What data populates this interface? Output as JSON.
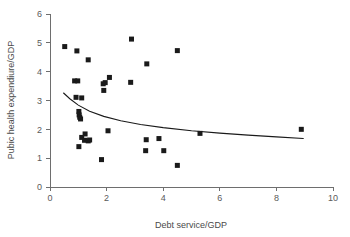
{
  "chart_data": {
    "type": "scatter",
    "title": "",
    "xlabel": "Debt service/GDP",
    "ylabel": "Pubic health expendiure/GDP",
    "xlim": [
      0,
      10
    ],
    "ylim": [
      0,
      6
    ],
    "xticks": [
      "0",
      "2",
      "4",
      "6",
      "8",
      "10"
    ],
    "xtick_values": [
      0,
      2,
      4,
      6,
      8,
      10
    ],
    "yticks": [
      "0",
      "1",
      "2",
      "3",
      "4",
      "5",
      "6"
    ],
    "ytick_values": [
      0,
      1,
      2,
      3,
      4,
      5,
      6
    ],
    "grid": false,
    "legend": null,
    "marker_shape": "square",
    "marker_color": "#1a1a1a",
    "points": [
      {
        "x": 0.52,
        "y": 4.87
      },
      {
        "x": 0.95,
        "y": 4.72
      },
      {
        "x": 1.35,
        "y": 4.41
      },
      {
        "x": 0.87,
        "y": 3.68
      },
      {
        "x": 0.98,
        "y": 3.68
      },
      {
        "x": 0.92,
        "y": 3.11
      },
      {
        "x": 1.12,
        "y": 3.09
      },
      {
        "x": 1.02,
        "y": 2.62
      },
      {
        "x": 1.03,
        "y": 2.5
      },
      {
        "x": 1.05,
        "y": 2.42
      },
      {
        "x": 1.08,
        "y": 2.36
      },
      {
        "x": 1.24,
        "y": 1.84
      },
      {
        "x": 1.12,
        "y": 1.72
      },
      {
        "x": 1.22,
        "y": 1.62
      },
      {
        "x": 1.35,
        "y": 1.6
      },
      {
        "x": 1.4,
        "y": 1.63
      },
      {
        "x": 1.02,
        "y": 1.4
      },
      {
        "x": 1.82,
        "y": 0.95
      },
      {
        "x": 1.9,
        "y": 3.35
      },
      {
        "x": 1.88,
        "y": 3.58
      },
      {
        "x": 1.95,
        "y": 3.62
      },
      {
        "x": 2.1,
        "y": 3.8
      },
      {
        "x": 2.05,
        "y": 1.95
      },
      {
        "x": 2.88,
        "y": 5.13
      },
      {
        "x": 2.85,
        "y": 3.63
      },
      {
        "x": 3.42,
        "y": 4.27
      },
      {
        "x": 3.4,
        "y": 1.64
      },
      {
        "x": 3.38,
        "y": 1.26
      },
      {
        "x": 3.85,
        "y": 1.68
      },
      {
        "x": 4.02,
        "y": 1.26
      },
      {
        "x": 4.5,
        "y": 4.73
      },
      {
        "x": 4.5,
        "y": 0.75
      },
      {
        "x": 5.3,
        "y": 1.86
      },
      {
        "x": 8.88,
        "y": 2.0
      }
    ],
    "fit_curve": {
      "description": "decreasing fitted trend line",
      "points": [
        {
          "x": 0.48,
          "y": 3.26
        },
        {
          "x": 0.7,
          "y": 3.06
        },
        {
          "x": 1.0,
          "y": 2.84
        },
        {
          "x": 1.4,
          "y": 2.63
        },
        {
          "x": 1.9,
          "y": 2.45
        },
        {
          "x": 2.5,
          "y": 2.3
        },
        {
          "x": 3.2,
          "y": 2.17
        },
        {
          "x": 4.0,
          "y": 2.06
        },
        {
          "x": 5.0,
          "y": 1.95
        },
        {
          "x": 6.0,
          "y": 1.87
        },
        {
          "x": 7.0,
          "y": 1.8
        },
        {
          "x": 8.0,
          "y": 1.74
        },
        {
          "x": 8.95,
          "y": 1.68
        }
      ]
    }
  }
}
